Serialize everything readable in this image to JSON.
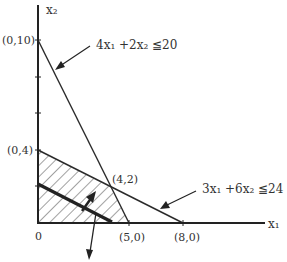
{
  "diagram": {
    "type": "linear-programming-feasible-region",
    "axes": {
      "x_label": "x₁",
      "y_label": "x₂",
      "origin_label": "0"
    },
    "points": {
      "p010": "(0,10)",
      "p04": "(0,4)",
      "p42": "(4,2)",
      "p50": "(5,0)",
      "p80": "(8,0)"
    },
    "constraints": [
      {
        "label": "4x₁ +2x₂ ≦20"
      },
      {
        "label": "3x₁ +6x₂ ≦24"
      }
    ],
    "feasible_region_vertices": [
      "(0,0)",
      "(0,4)",
      "(4,2)",
      "(5,0)"
    ],
    "colors": {
      "line": "#2a2a2a",
      "text": "#333333",
      "hatch": "#444444"
    }
  }
}
